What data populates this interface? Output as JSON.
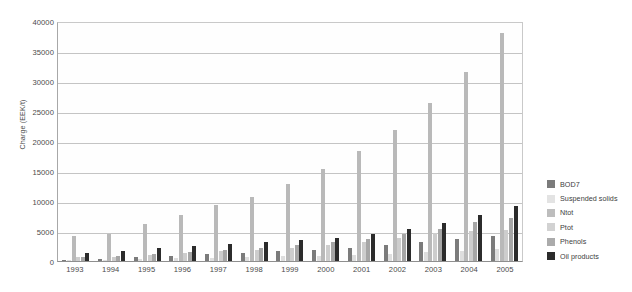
{
  "chart": {
    "type": "bar",
    "y_axis_title": "Charge (EEK/t)",
    "caption": ""
  },
  "chart_data": {
    "type": "bar",
    "title": "",
    "subtitle": "",
    "xlabel": "",
    "ylabel": "Charge (EEK/t)",
    "ylim": [
      0,
      40000
    ],
    "yticks": [
      0,
      5000,
      10000,
      15000,
      20000,
      25000,
      30000,
      35000,
      40000
    ],
    "ytick_labels": [
      "0",
      "5000",
      "10000",
      "15000",
      "20000",
      "25000",
      "30000",
      "35000",
      "40000"
    ],
    "grid": true,
    "legend_position": "right",
    "categories": [
      "1993",
      "1994",
      "1995",
      "1996",
      "1997",
      "1998",
      "1999",
      "2000",
      "2001",
      "2002",
      "2003",
      "2004",
      "2005"
    ],
    "series": [
      {
        "name": "BOD7",
        "color": "#7b7b7b",
        "values": [
          180,
          260,
          700,
          900,
          1100,
          1350,
          1600,
          1850,
          2200,
          2600,
          3100,
          3600,
          4100
        ]
      },
      {
        "name": "Suspended solids",
        "color": "#dedede",
        "values": [
          120,
          180,
          300,
          420,
          500,
          620,
          760,
          880,
          1050,
          1250,
          1500,
          1750,
          1950
        ]
      },
      {
        "name": "Ntot",
        "color": "#b9b9b9",
        "values": [
          4150,
          4500,
          6100,
          7750,
          9300,
          10750,
          12800,
          15300,
          18300,
          21900,
          26300,
          31500,
          38000
        ]
      },
      {
        "name": "Ptot",
        "color": "#cdcdcd",
        "values": [
          600,
          700,
          1000,
          1300,
          1600,
          1900,
          2250,
          2650,
          3200,
          3900,
          4700,
          5000,
          5200
        ]
      },
      {
        "name": "Phenols",
        "color": "#a6a6a6",
        "values": [
          700,
          850,
          1150,
          1500,
          1900,
          2200,
          2600,
          3100,
          3700,
          4500,
          5400,
          6500,
          7100
        ]
      },
      {
        "name": "Oil products",
        "color": "#2b2b2b",
        "values": [
          1350,
          1600,
          2100,
          2550,
          2900,
          3200,
          3500,
          3900,
          4500,
          5300,
          6300,
          7700,
          9100
        ]
      }
    ]
  },
  "legend": {
    "items": [
      {
        "label": "BOD7",
        "color": "#7b7b7b"
      },
      {
        "label": "Suspended solids",
        "color": "#e3e3e3"
      },
      {
        "label": "Ntot",
        "color": "#bdbdbd"
      },
      {
        "label": "Ptot",
        "color": "#d2d2d2"
      },
      {
        "label": "Phenols",
        "color": "#ababab"
      },
      {
        "label": "Oil products",
        "color": "#2b2b2b"
      }
    ]
  }
}
